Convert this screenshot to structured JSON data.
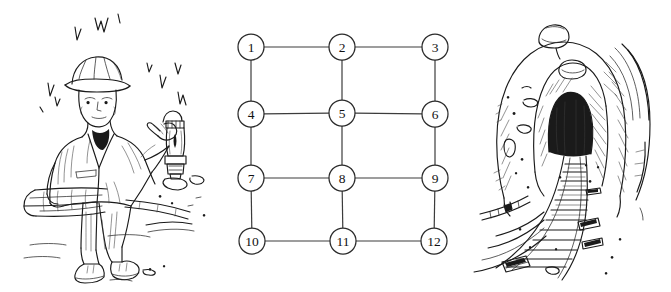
{
  "figure": {
    "background_color": "#ffffff",
    "width": 671,
    "height": 292,
    "panels": [
      {
        "name": "miner-illustration",
        "caption": "Miner with hard hat holding a lantern, seated on timber planks"
      },
      {
        "name": "grid-graph",
        "caption": "3 by 4 grid graph with twelve numbered nodes"
      },
      {
        "name": "tunnel-illustration",
        "caption": "Mine tunnel entrance with curving rail track"
      }
    ]
  },
  "graph": {
    "type": "grid-graph",
    "rows": 4,
    "columns": 3,
    "node_radius": 13,
    "node_fill": "#ffffff",
    "node_stroke": "#2b2b2b",
    "edge_stroke": "#3c3c3c",
    "nodes": [
      {
        "id": 1,
        "label": "1",
        "cx": 26,
        "cy": 47,
        "row": 1,
        "col": 1
      },
      {
        "id": 2,
        "label": "2",
        "cx": 117,
        "cy": 47,
        "row": 1,
        "col": 2
      },
      {
        "id": 3,
        "label": "3",
        "cx": 210,
        "cy": 47,
        "row": 1,
        "col": 3
      },
      {
        "id": 4,
        "label": "4",
        "cx": 26,
        "cy": 114,
        "row": 2,
        "col": 1
      },
      {
        "id": 5,
        "label": "5",
        "cx": 117,
        "cy": 113,
        "row": 2,
        "col": 2
      },
      {
        "id": 6,
        "label": "6",
        "cx": 210,
        "cy": 114,
        "row": 2,
        "col": 3
      },
      {
        "id": 7,
        "label": "7",
        "cx": 26,
        "cy": 178,
        "row": 3,
        "col": 1
      },
      {
        "id": 8,
        "label": "8",
        "cx": 117,
        "cy": 178,
        "row": 3,
        "col": 2
      },
      {
        "id": 9,
        "label": "9",
        "cx": 210,
        "cy": 178,
        "row": 3,
        "col": 3
      },
      {
        "id": 10,
        "label": "10",
        "cx": 27,
        "cy": 241,
        "row": 4,
        "col": 1
      },
      {
        "id": 11,
        "label": "11",
        "cx": 118,
        "cy": 241,
        "row": 4,
        "col": 2
      },
      {
        "id": 12,
        "label": "12",
        "cx": 209,
        "cy": 241,
        "row": 4,
        "col": 3
      }
    ],
    "edges": [
      {
        "from": 1,
        "to": 2
      },
      {
        "from": 2,
        "to": 3
      },
      {
        "from": 4,
        "to": 5
      },
      {
        "from": 5,
        "to": 6
      },
      {
        "from": 7,
        "to": 8
      },
      {
        "from": 8,
        "to": 9
      },
      {
        "from": 10,
        "to": 11
      },
      {
        "from": 11,
        "to": 12
      },
      {
        "from": 1,
        "to": 4
      },
      {
        "from": 2,
        "to": 5
      },
      {
        "from": 3,
        "to": 6
      },
      {
        "from": 4,
        "to": 7
      },
      {
        "from": 5,
        "to": 8
      },
      {
        "from": 6,
        "to": 9
      },
      {
        "from": 7,
        "to": 10
      },
      {
        "from": 8,
        "to": 11
      },
      {
        "from": 9,
        "to": 12
      }
    ]
  },
  "illustrations": {
    "miner": {
      "name": "miner-drawing",
      "style": "pen-and-ink line art",
      "elements": [
        "hard-hat",
        "face",
        "jacket",
        "gloved-hand",
        "lantern",
        "trousers",
        "boots",
        "timber-planks",
        "water-drips"
      ]
    },
    "tunnel": {
      "name": "tunnel-drawing",
      "style": "pen-and-ink line art",
      "elements": [
        "tunnel-arch",
        "dark-opening",
        "rock-face-hatching",
        "rail-track",
        "sleepers",
        "pipe",
        "debris"
      ]
    }
  }
}
